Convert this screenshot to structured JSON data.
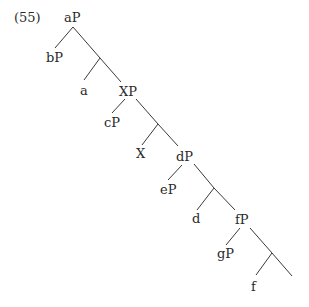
{
  "example_number": "(55)",
  "nodes": {
    "aP": "aP",
    "bP": "bP",
    "a": "a",
    "XP": "XP",
    "cP": "cP",
    "X": "X",
    "dP": "dP",
    "eP": "eP",
    "d": "d",
    "fP": "fP",
    "gP": "gP",
    "f": "f"
  },
  "tree_structure": {
    "label": "aP",
    "children": [
      {
        "label": "bP"
      },
      {
        "label": "",
        "children": [
          {
            "label": "a"
          },
          {
            "label": "XP",
            "children": [
              {
                "label": "cP"
              },
              {
                "label": "",
                "children": [
                  {
                    "label": "X"
                  },
                  {
                    "label": "dP",
                    "children": [
                      {
                        "label": "eP"
                      },
                      {
                        "label": "",
                        "children": [
                          {
                            "label": "d"
                          },
                          {
                            "label": "fP",
                            "children": [
                              {
                                "label": "gP"
                              },
                              {
                                "label": "",
                                "children": [
                                  {
                                    "label": "f"
                                  },
                                  {
                                    "label": ""
                                  }
                                ]
                              }
                            ]
                          }
                        ]
                      }
                    ]
                  }
                ]
              }
            ]
          }
        ]
      }
    ]
  }
}
